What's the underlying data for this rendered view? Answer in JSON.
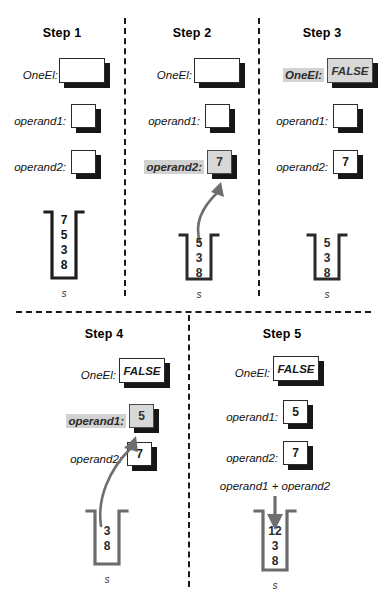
{
  "figure": {
    "steps": [
      {
        "id": "step1",
        "title": "Step 1",
        "variables": [
          {
            "name": "oneel",
            "label": "OneEl:",
            "value": "",
            "highlighted": false,
            "wide": true
          },
          {
            "name": "operand1",
            "label": "operand1:",
            "value": "",
            "highlighted": false,
            "wide": false
          },
          {
            "name": "operand2",
            "label": "operand2:",
            "value": "",
            "highlighted": false,
            "wide": false
          }
        ],
        "stack": {
          "name": "s",
          "items": [
            "7",
            "5",
            "3",
            "8"
          ]
        },
        "arrow": null,
        "expression": null
      },
      {
        "id": "step2",
        "title": "Step 2",
        "variables": [
          {
            "name": "oneel",
            "label": "OneEl:",
            "value": "",
            "highlighted": false,
            "wide": true
          },
          {
            "name": "operand1",
            "label": "operand1:",
            "value": "",
            "highlighted": false,
            "wide": false
          },
          {
            "name": "operand2",
            "label": "operand2:",
            "value": "7",
            "highlighted": true,
            "wide": false
          }
        ],
        "stack": {
          "name": "s",
          "items": [
            "5",
            "3",
            "8"
          ]
        },
        "arrow": "curved-pop-to-operand2",
        "expression": null
      },
      {
        "id": "step3",
        "title": "Step 3",
        "variables": [
          {
            "name": "oneel",
            "label": "OneEl:",
            "value": "FALSE",
            "highlighted": true,
            "wide": true
          },
          {
            "name": "operand1",
            "label": "operand1:",
            "value": "",
            "highlighted": false,
            "wide": false
          },
          {
            "name": "operand2",
            "label": "operand2:",
            "value": "7",
            "highlighted": false,
            "wide": false
          }
        ],
        "stack": {
          "name": "s",
          "items": [
            "5",
            "3",
            "8"
          ]
        },
        "arrow": null,
        "expression": null
      },
      {
        "id": "step4",
        "title": "Step 4",
        "variables": [
          {
            "name": "oneel",
            "label": "OneEl:",
            "value": "FALSE",
            "highlighted": false,
            "wide": true
          },
          {
            "name": "operand1",
            "label": "operand1:",
            "value": "5",
            "highlighted": true,
            "wide": false
          },
          {
            "name": "operand2",
            "label": "operand2:",
            "value": "7",
            "highlighted": false,
            "wide": false
          }
        ],
        "stack": {
          "name": "s",
          "items": [
            "3",
            "8"
          ]
        },
        "arrow": "curved-pop-to-operand1",
        "expression": null
      },
      {
        "id": "step5",
        "title": "Step 5",
        "variables": [
          {
            "name": "oneel",
            "label": "OneEl:",
            "value": "FALSE",
            "highlighted": false,
            "wide": true
          },
          {
            "name": "operand1",
            "label": "operand1:",
            "value": "5",
            "highlighted": false,
            "wide": false
          },
          {
            "name": "operand2",
            "label": "operand2:",
            "value": "7",
            "highlighted": false,
            "wide": false
          }
        ],
        "stack": {
          "name": "s",
          "items": [
            "12",
            "3",
            "8"
          ]
        },
        "arrow": "straight-push-into-stack",
        "expression": "operand1 + operand2"
      }
    ],
    "colors": {
      "stroke": "#2a2a2a",
      "shadow": "#171717",
      "highlight_fill": "#d8d8d8",
      "label_highlight": "#d2d2d2",
      "arrow": "#6e6e6e",
      "stack_stroke_gray": "#6b6b6b",
      "divider": "#1a1a1a"
    }
  }
}
